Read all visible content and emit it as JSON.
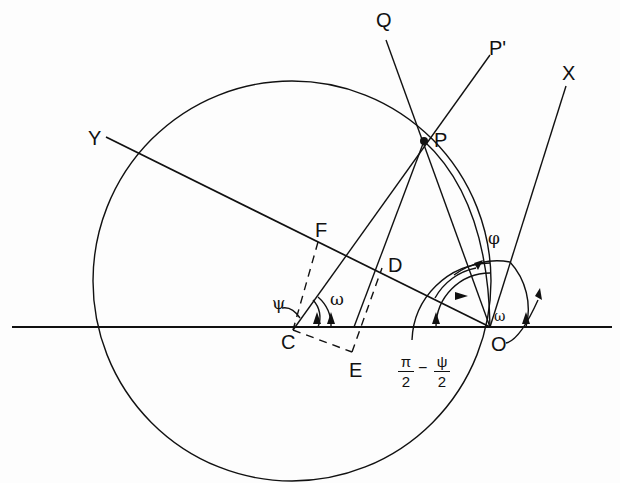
{
  "diagram": {
    "points": {
      "P": "P",
      "P_prime": "P'",
      "Q": "Q",
      "X": "X",
      "Y": "Y",
      "C": "C",
      "O": "O",
      "D": "D",
      "E": "E",
      "F": "F"
    },
    "angles": {
      "psi": "ψ",
      "omega_at_C": "ω",
      "omega_at_O": "ω",
      "phi": "φ",
      "half_angle_num1": "π",
      "half_angle_den1": "2",
      "half_angle_minus": "−",
      "half_angle_num2": "ψ",
      "half_angle_den2": "2"
    },
    "colors": {
      "stroke": "#111111",
      "background": "#fdfdfd"
    }
  }
}
